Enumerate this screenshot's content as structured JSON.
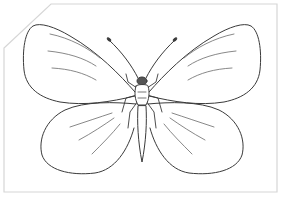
{
  "image": {
    "subject": "butterfly-coloring-page",
    "style": "line-art outline",
    "colors": {
      "background": "#ffffff",
      "card_border": "#d6d6d6",
      "line": "#3a3a3a",
      "vein": "#6a6a6a",
      "head_fill": "#555555"
    }
  }
}
